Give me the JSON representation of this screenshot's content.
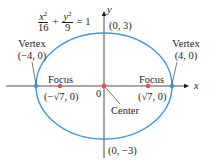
{
  "equation": {
    "term1": {
      "numerator_var": "x",
      "exponent": "2",
      "denominator": "16"
    },
    "plus": "+",
    "term2": {
      "numerator_var": "y",
      "exponent": "2",
      "denominator": "9"
    },
    "equals": "= 1"
  },
  "axes": {
    "x_label": "x",
    "y_label": "y",
    "origin_label": "0"
  },
  "labels": {
    "top_point": "(0, 3)",
    "bottom_point": "(0, −3)",
    "left_vertex_title": "Vertex",
    "left_vertex_coord": "(−4, 0)",
    "right_vertex_title": "Vertex",
    "right_vertex_coord": "(4, 0)",
    "left_focus_title": "Focus",
    "left_focus_coord": "(−√7, 0)",
    "right_focus_title": "Focus",
    "right_focus_coord": "(√7, 0)",
    "center": "Center"
  },
  "colors": {
    "ellipse": "#3a9ad9",
    "focus_point": "#e0505a",
    "axis": "#231f20",
    "vertex_point": "#3a9ad9"
  }
}
